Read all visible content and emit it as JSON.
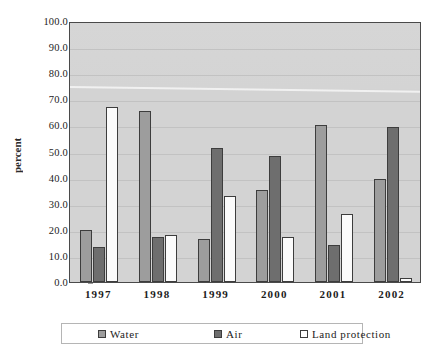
{
  "chart_data": {
    "type": "bar",
    "title": "",
    "subtitle": "",
    "xlabel": "",
    "ylabel": "percent",
    "categories": [
      "1997",
      "1998",
      "1999",
      "2000",
      "2001",
      "2002"
    ],
    "series": [
      {
        "name": "Water",
        "color": "#9d9d9d",
        "values": [
          20.1,
          65.6,
          16.3,
          35.1,
          60.2,
          39.6
        ]
      },
      {
        "name": "Air",
        "color": "#6e6e6e",
        "values": [
          13.3,
          17.2,
          51.5,
          48.3,
          14.1,
          59.5
        ]
      },
      {
        "name": "Land protection",
        "color": "#ffffff",
        "values": [
          67.0,
          18.0,
          33.0,
          17.3,
          26.2,
          1.5
        ]
      }
    ],
    "ylim": [
      0,
      100
    ],
    "ytick_step": 10,
    "ytick_labels": [
      "100.0",
      "90.0",
      "80.0",
      "70.0",
      "60.0",
      "50.0",
      "40.0",
      "30.0",
      "20.0",
      "10.0",
      "0.0"
    ],
    "ytick_values": [
      100,
      90,
      80,
      70,
      60,
      50,
      40,
      30,
      20,
      10,
      0
    ],
    "grid": true,
    "legend_position": "bottom",
    "plot_background": "#d3d3d3",
    "page_background": "#ffffff",
    "axis_color": "#4a4a4a"
  }
}
